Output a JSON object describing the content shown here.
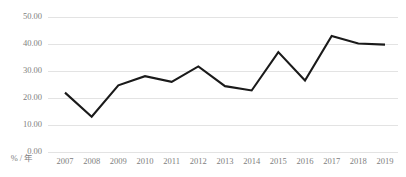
{
  "chart_data": {
    "type": "line",
    "title": "",
    "xlabel": "% / 年",
    "ylabel": "",
    "categories": [
      "2007",
      "2008",
      "2009",
      "2010",
      "2011",
      "2012",
      "2013",
      "2014",
      "2015",
      "2016",
      "2017",
      "2018",
      "2019"
    ],
    "values": [
      21.8,
      12.9,
      24.5,
      27.9,
      25.8,
      31.5,
      24.2,
      22.6,
      36.8,
      26.3,
      42.8,
      40.0,
      39.6
    ],
    "series": [
      {
        "name": "",
        "values": [
          21.8,
          12.9,
          24.5,
          27.9,
          25.8,
          31.5,
          24.2,
          22.6,
          36.8,
          26.3,
          42.8,
          40.0,
          39.6
        ]
      }
    ],
    "ylim": [
      0,
      50
    ],
    "ytick_labels": [
      "50.00",
      "40.00",
      "30.00",
      "20.00",
      "10.00",
      "0.00"
    ],
    "ytick_values": [
      50,
      40,
      30,
      20,
      10,
      0
    ],
    "xtick_labels": [
      "2007",
      "2008",
      "2009",
      "2010",
      "2011",
      "2012",
      "2013",
      "2014",
      "2015",
      "2016",
      "2017",
      "2018",
      "2019"
    ],
    "grid": "horizontal",
    "legend": "none",
    "colors": {
      "line": "#1a1a1a",
      "grid": "#e3e3e3",
      "tick_text": "#808080",
      "background": "#ffffff"
    }
  },
  "axis": {
    "unit_label": "% / 年"
  }
}
